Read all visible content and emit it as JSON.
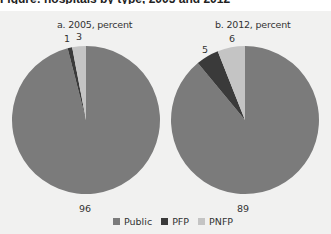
{
  "figure": {
    "cropped_title": "Figure: hospitals by type, 2005 and 2012"
  },
  "colors": {
    "Public": "#7b7b7b",
    "PFP": "#3a3a3a",
    "PNFP": "#c4c4c4",
    "background": "#f1f1f0"
  },
  "legend": {
    "items": [
      {
        "label": "Public",
        "color": "#7b7b7b"
      },
      {
        "label": "PFP",
        "color": "#3a3a3a"
      },
      {
        "label": "PNFP",
        "color": "#c4c4c4"
      }
    ]
  },
  "chart_data": [
    {
      "type": "pie",
      "title": "a. 2005, percent",
      "categories": [
        "Public",
        "PFP",
        "PNFP"
      ],
      "values": [
        96,
        1,
        3
      ],
      "labels": [
        "96",
        "1",
        "3"
      ],
      "legend_position": "bottom"
    },
    {
      "type": "pie",
      "title": "b. 2012, percent",
      "categories": [
        "Public",
        "PFP",
        "PNFP"
      ],
      "values": [
        89,
        5,
        6
      ],
      "labels": [
        "89",
        "5",
        "6"
      ],
      "legend_position": "bottom"
    }
  ]
}
